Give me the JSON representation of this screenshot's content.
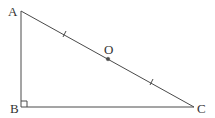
{
  "figure": {
    "type": "right-triangle",
    "stroke_color": "#4a4a4a",
    "label_color": "#333333",
    "vertices": {
      "A": {
        "label": "A",
        "x": 21,
        "y": 11
      },
      "B": {
        "label": "B",
        "x": 21,
        "y": 107
      },
      "C": {
        "label": "C",
        "x": 194,
        "y": 107
      }
    },
    "midpoint": {
      "label": "O",
      "x": 108,
      "y": 59,
      "on_segment": "AC"
    },
    "right_angle_at": "B",
    "equal_tick_marks": [
      "AO",
      "OC"
    ]
  }
}
